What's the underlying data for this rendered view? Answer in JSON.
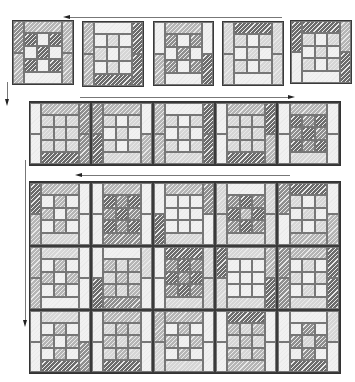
{
  "diagram": {
    "title": "",
    "shades": {
      "w": "#f1f1f1",
      "l": "#d6d6d6",
      "m": "#b5b5b5",
      "d": "#8f8f8f",
      "k": "#6c6c6c"
    },
    "arrows": [
      {
        "id": "arrow-top-left",
        "direction": "left",
        "x1": 68,
        "y1": 17,
        "x2": 282,
        "y2": 17
      },
      {
        "id": "arrow-down-1",
        "direction": "down",
        "x1": 7,
        "y1": 82,
        "x2": 7,
        "y2": 101
      },
      {
        "id": "arrow-row2-right",
        "direction": "right",
        "x1": 80,
        "y1": 97,
        "x2": 290,
        "y2": 97
      },
      {
        "id": "arrow-down-2",
        "direction": "down",
        "x1": 25,
        "y1": 160,
        "x2": 25,
        "y2": 322
      },
      {
        "id": "arrow-row3-left",
        "direction": "left",
        "x1": 80,
        "y1": 175,
        "x2": 290,
        "y2": 175
      }
    ],
    "rows": [
      {
        "name": "row-1",
        "blocks": [
          {
            "x": 12,
            "y": 20,
            "w": 62,
            "h": 65,
            "top": "m",
            "bottom": "w",
            "left": [
              "d",
              "m"
            ],
            "right": [
              "m",
              "m"
            ],
            "center": [
              "k",
              "w",
              "k",
              "w",
              "k",
              "w",
              "k",
              "w",
              "k"
            ]
          },
          {
            "x": 82,
            "y": 21,
            "w": 62,
            "h": 66,
            "top": "w",
            "bottom": "k",
            "left": [
              "m",
              "m"
            ],
            "right": [
              "k",
              "k"
            ],
            "center": [
              "w",
              "l",
              "w",
              "l",
              "w",
              "l",
              "w",
              "l",
              "w"
            ]
          },
          {
            "x": 153,
            "y": 21,
            "w": 61,
            "h": 65,
            "top": "m",
            "bottom": "w",
            "left": [
              "w",
              "m"
            ],
            "right": [
              "w",
              "k"
            ],
            "center": [
              "d",
              "w",
              "d",
              "w",
              "d",
              "w",
              "d",
              "w",
              "d"
            ]
          },
          {
            "x": 222,
            "y": 21,
            "w": 62,
            "h": 65,
            "top": "k",
            "bottom": "w",
            "left": [
              "l",
              "l"
            ],
            "right": [
              "l",
              "l"
            ],
            "center": [
              "l",
              "w",
              "l",
              "w",
              "l",
              "w",
              "l",
              "w",
              "l"
            ]
          },
          {
            "x": 290,
            "y": 20,
            "w": 62,
            "h": 64,
            "top": "k",
            "bottom": "w",
            "left": [
              "k",
              "w"
            ],
            "right": [
              "m",
              "k"
            ],
            "center": [
              "l",
              "w",
              "l",
              "w",
              "l",
              "w",
              "l",
              "w",
              "l"
            ]
          }
        ]
      },
      {
        "name": "row-2",
        "blocks": [
          {
            "x": 29,
            "y": 102,
            "w": 62,
            "h": 63,
            "top": "m",
            "bottom": "k",
            "left": [
              "w",
              "w"
            ],
            "right": [
              "d",
              "d"
            ],
            "center": [
              "l",
              "l",
              "l",
              "l",
              "l",
              "l",
              "l",
              "l",
              "l"
            ]
          },
          {
            "x": 91,
            "y": 102,
            "w": 62,
            "h": 63,
            "top": "m",
            "bottom": "l",
            "left": [
              "d",
              "k"
            ],
            "right": [
              "w",
              "m"
            ],
            "center": [
              "l",
              "w",
              "l",
              "w",
              "l",
              "w",
              "l",
              "w",
              "l"
            ]
          },
          {
            "x": 153,
            "y": 102,
            "w": 62,
            "h": 63,
            "top": "w",
            "bottom": "l",
            "left": [
              "m",
              "m"
            ],
            "right": [
              "k",
              "k"
            ],
            "center": [
              "l",
              "w",
              "l",
              "w",
              "l",
              "w",
              "l",
              "w",
              "l"
            ]
          },
          {
            "x": 215,
            "y": 102,
            "w": 62,
            "h": 63,
            "top": "m",
            "bottom": "k",
            "left": [
              "w",
              "w"
            ],
            "right": [
              "k",
              "m"
            ],
            "center": [
              "l",
              "l",
              "l",
              "l",
              "l",
              "l",
              "l",
              "l",
              "l"
            ]
          },
          {
            "x": 277,
            "y": 102,
            "w": 63,
            "h": 63,
            "top": "m",
            "bottom": "l",
            "left": [
              "w",
              "w"
            ],
            "right": [
              "w",
              "w"
            ],
            "center": [
              "k",
              "d",
              "k",
              "d",
              "k",
              "d",
              "k",
              "d",
              "k"
            ]
          }
        ]
      },
      {
        "name": "grid-row-1",
        "blocks": [
          {
            "x": 29,
            "y": 182,
            "w": 62,
            "h": 64,
            "top": "m",
            "bottom": "l",
            "left": [
              "k",
              "m"
            ],
            "right": [
              "w",
              "w"
            ],
            "center": [
              "w",
              "m",
              "w",
              "m",
              "w",
              "m",
              "w",
              "m",
              "w"
            ]
          },
          {
            "x": 91,
            "y": 182,
            "w": 62,
            "h": 64,
            "top": "m",
            "bottom": "d",
            "left": [
              "w",
              "w"
            ],
            "right": [
              "w",
              "w"
            ],
            "center": [
              "k",
              "d",
              "k",
              "d",
              "k",
              "d",
              "k",
              "d",
              "k"
            ]
          },
          {
            "x": 153,
            "y": 182,
            "w": 62,
            "h": 64,
            "top": "m",
            "bottom": "l",
            "left": [
              "w",
              "k"
            ],
            "right": [
              "d",
              "w"
            ],
            "center": [
              "w",
              "w",
              "w",
              "w",
              "w",
              "w",
              "w",
              "w",
              "w"
            ]
          },
          {
            "x": 215,
            "y": 182,
            "w": 62,
            "h": 64,
            "top": "w",
            "bottom": "l",
            "left": [
              "l",
              "l"
            ],
            "right": [
              "l",
              "l"
            ],
            "center": [
              "d",
              "k",
              "d",
              "k",
              "m",
              "k",
              "d",
              "k",
              "d"
            ]
          },
          {
            "x": 277,
            "y": 182,
            "w": 63,
            "h": 64,
            "top": "k",
            "bottom": "m",
            "left": [
              "d",
              "w"
            ],
            "right": [
              "w",
              "m"
            ],
            "center": [
              "l",
              "w",
              "l",
              "w",
              "l",
              "w",
              "l",
              "w",
              "l"
            ]
          }
        ]
      },
      {
        "name": "grid-row-2",
        "blocks": [
          {
            "x": 29,
            "y": 246,
            "w": 62,
            "h": 64,
            "top": "l",
            "bottom": "w",
            "left": [
              "m",
              "m"
            ],
            "right": [
              "w",
              "w"
            ],
            "center": [
              "w",
              "m",
              "w",
              "m",
              "w",
              "m",
              "w",
              "m",
              "w"
            ]
          },
          {
            "x": 91,
            "y": 246,
            "w": 62,
            "h": 64,
            "top": "w",
            "bottom": "d",
            "left": [
              "w",
              "k"
            ],
            "right": [
              "l",
              "w"
            ],
            "center": [
              "m",
              "l",
              "m",
              "l",
              "m",
              "l",
              "m",
              "l",
              "m"
            ]
          },
          {
            "x": 153,
            "y": 246,
            "w": 62,
            "h": 64,
            "top": "k",
            "bottom": "l",
            "left": [
              "w",
              "w"
            ],
            "right": [
              "l",
              "l"
            ],
            "center": [
              "d",
              "k",
              "d",
              "k",
              "d",
              "k",
              "d",
              "k",
              "d"
            ]
          },
          {
            "x": 215,
            "y": 246,
            "w": 62,
            "h": 64,
            "top": "l",
            "bottom": "l",
            "left": [
              "k",
              "l"
            ],
            "right": [
              "m",
              "k"
            ],
            "center": [
              "w",
              "w",
              "w",
              "w",
              "w",
              "w",
              "w",
              "w",
              "w"
            ]
          },
          {
            "x": 277,
            "y": 246,
            "w": 63,
            "h": 64,
            "top": "m",
            "bottom": "l",
            "left": [
              "d",
              "d"
            ],
            "right": [
              "k",
              "k"
            ],
            "center": [
              "w",
              "l",
              "w",
              "l",
              "w",
              "l",
              "w",
              "l",
              "w"
            ]
          }
        ]
      },
      {
        "name": "grid-row-3",
        "blocks": [
          {
            "x": 29,
            "y": 310,
            "w": 62,
            "h": 63,
            "top": "l",
            "bottom": "k",
            "left": [
              "w",
              "w"
            ],
            "right": [
              "w",
              "d"
            ],
            "center": [
              "w",
              "m",
              "w",
              "m",
              "w",
              "m",
              "w",
              "m",
              "w"
            ]
          },
          {
            "x": 91,
            "y": 310,
            "w": 62,
            "h": 63,
            "top": "m",
            "bottom": "k",
            "left": [
              "w",
              "w"
            ],
            "right": [
              "w",
              "w"
            ],
            "center": [
              "l",
              "m",
              "l",
              "m",
              "l",
              "m",
              "l",
              "m",
              "l"
            ]
          },
          {
            "x": 153,
            "y": 310,
            "w": 62,
            "h": 63,
            "top": "m",
            "bottom": "l",
            "left": [
              "m",
              "l"
            ],
            "right": [
              "w",
              "w"
            ],
            "center": [
              "w",
              "m",
              "w",
              "m",
              "w",
              "m",
              "w",
              "m",
              "w"
            ]
          },
          {
            "x": 215,
            "y": 310,
            "w": 62,
            "h": 63,
            "top": "k",
            "bottom": "m",
            "left": [
              "w",
              "w"
            ],
            "right": [
              "w",
              "w"
            ],
            "center": [
              "m",
              "l",
              "m",
              "l",
              "m",
              "l",
              "m",
              "l",
              "m"
            ]
          },
          {
            "x": 277,
            "y": 310,
            "w": 63,
            "h": 63,
            "top": "w",
            "bottom": "k",
            "left": [
              "w",
              "w"
            ],
            "right": [
              "l",
              "w"
            ],
            "center": [
              "w",
              "d",
              "w",
              "d",
              "l",
              "d",
              "w",
              "d",
              "w"
            ]
          }
        ]
      }
    ],
    "grid_frames": [
      {
        "x": 29,
        "y": 101,
        "w": 312,
        "h": 65
      },
      {
        "x": 29,
        "y": 181,
        "w": 312,
        "h": 193
      }
    ]
  }
}
